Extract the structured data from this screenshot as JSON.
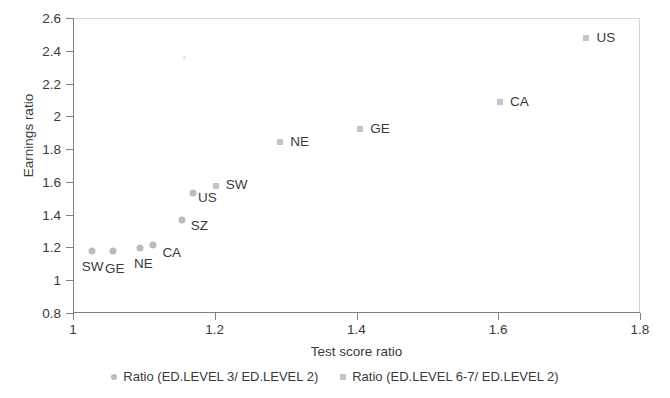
{
  "chart_data": {
    "type": "scatter",
    "title": "",
    "xlabel": "Test score ratio",
    "ylabel": "Earnings ratio",
    "xlim": [
      1,
      1.8
    ],
    "ylim": [
      0.8,
      2.6
    ],
    "xticks": [
      "1",
      "1.2",
      "1.4",
      "1.6",
      "1.8"
    ],
    "xtick_values": [
      1,
      1.2,
      1.4,
      1.6,
      1.8
    ],
    "yticks": [
      "0.8",
      "1",
      "1.2",
      "1.4",
      "1.6",
      "1.8",
      "2",
      "2.2",
      "2.4",
      "2.6"
    ],
    "ytick_values": [
      0.8,
      1.0,
      1.2,
      1.4,
      1.6,
      1.8,
      2.0,
      2.2,
      2.4,
      2.6
    ],
    "grid": false,
    "legend_position": "bottom",
    "series": [
      {
        "name": "Ratio (ED.LEVEL 3/ ED.LEVEL 2)",
        "marker": "circle",
        "color": "#bcbcbc",
        "points": [
          {
            "label": "SW",
            "x": 1.025,
            "y": 1.18,
            "label_dx": -10,
            "label_dy": 16
          },
          {
            "label": "GE",
            "x": 1.055,
            "y": 1.18,
            "label_dx": -8,
            "label_dy": 18
          },
          {
            "label": "NE",
            "x": 1.093,
            "y": 1.195,
            "label_dx": -6,
            "label_dy": 16
          },
          {
            "label": "CA",
            "x": 1.112,
            "y": 1.215,
            "label_dx": 9,
            "label_dy": 8
          },
          {
            "label": "SZ",
            "x": 1.152,
            "y": 1.37,
            "label_dx": 9,
            "label_dy": 6
          },
          {
            "label": "US",
            "x": 1.168,
            "y": 1.535,
            "label_dx": 5,
            "label_dy": 5
          }
        ]
      },
      {
        "name": "Ratio (ED.LEVEL 6-7/ ED.LEVEL 2)",
        "marker": "square",
        "color": "#c4c4c4",
        "points": [
          {
            "label": "SW",
            "x": 1.2,
            "y": 1.575,
            "label_dx": 10,
            "label_dy": -1
          },
          {
            "label": "NE",
            "x": 1.291,
            "y": 1.845,
            "label_dx": 10,
            "label_dy": 0
          },
          {
            "label": "GE",
            "x": 1.404,
            "y": 1.925,
            "label_dx": 10,
            "label_dy": 0
          },
          {
            "label": "CA",
            "x": 1.601,
            "y": 2.09,
            "label_dx": 10,
            "label_dy": 0
          },
          {
            "label": "US",
            "x": 1.723,
            "y": 2.48,
            "label_dx": 10,
            "label_dy": 0
          }
        ]
      }
    ]
  },
  "legend": {
    "items": [
      {
        "label": "Ratio (ED.LEVEL 3/ ED.LEVEL 2)",
        "marker": "circle"
      },
      {
        "label": "Ratio (ED.LEVEL 6-7/ ED.LEVEL 2)",
        "marker": "square"
      }
    ]
  }
}
